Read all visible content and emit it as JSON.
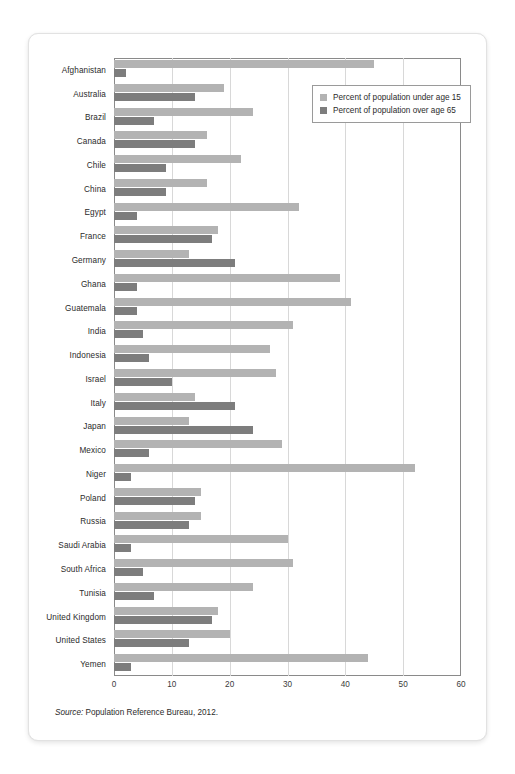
{
  "chart_data": {
    "type": "bar",
    "orientation": "horizontal",
    "title": "",
    "xlabel": "",
    "ylabel": "",
    "xlim": [
      0,
      60
    ],
    "xticks": [
      0,
      10,
      20,
      30,
      40,
      50,
      60
    ],
    "grid": true,
    "legend_position": "top-right inside plot",
    "categories": [
      "Afghanistan",
      "Australia",
      "Brazil",
      "Canada",
      "Chile",
      "China",
      "Egypt",
      "France",
      "Germany",
      "Ghana",
      "Guatemala",
      "India",
      "Indonesia",
      "Israel",
      "Italy",
      "Japan",
      "Mexico",
      "Niger",
      "Poland",
      "Russia",
      "Saudi Arabia",
      "South Africa",
      "Tunisia",
      "United Kingdom",
      "United States",
      "Yemen"
    ],
    "series": [
      {
        "name": "Percent of population under age 15",
        "color": "#b3b3b3",
        "values": [
          45,
          19,
          24,
          16,
          22,
          16,
          32,
          18,
          13,
          39,
          41,
          31,
          27,
          28,
          14,
          13,
          29,
          52,
          15,
          15,
          30,
          31,
          24,
          18,
          20,
          44
        ]
      },
      {
        "name": "Percent of population over age 65",
        "color": "#7d7d7d",
        "values": [
          2,
          14,
          7,
          14,
          9,
          9,
          4,
          17,
          21,
          4,
          4,
          5,
          6,
          10,
          21,
          24,
          6,
          3,
          14,
          13,
          3,
          5,
          7,
          17,
          13,
          3
        ]
      }
    ],
    "source_prefix": "Source:",
    "source_text": "Population Reference Bureau, 2012."
  }
}
